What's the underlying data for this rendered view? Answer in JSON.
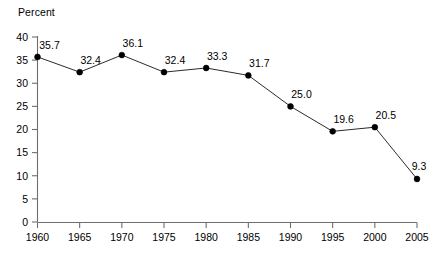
{
  "chart_data": {
    "type": "line",
    "title": "",
    "subtitle": "",
    "xlabel": "",
    "ylabel": "Percent",
    "x": [
      1960,
      1965,
      1970,
      1975,
      1980,
      1985,
      1990,
      1995,
      2000,
      2005
    ],
    "categories": [
      "1960",
      "1965",
      "1970",
      "1975",
      "1980",
      "1985",
      "1990",
      "1995",
      "2000",
      "2005"
    ],
    "values": [
      35.7,
      32.4,
      36.1,
      32.4,
      33.3,
      31.7,
      25.0,
      19.6,
      20.5,
      9.3
    ],
    "point_labels": [
      "35.7",
      "32.4",
      "36.1",
      "32.4",
      "33.3",
      "31.7",
      "25.0",
      "19.6",
      "20.5",
      "9.3"
    ],
    "series": [
      {
        "name": "Percent",
        "values": [
          35.7,
          32.4,
          36.1,
          32.4,
          33.3,
          31.7,
          25.0,
          19.6,
          20.5,
          9.3
        ]
      }
    ],
    "ylim": [
      0,
      40
    ],
    "ytick_values": [
      0,
      5,
      10,
      15,
      20,
      25,
      30,
      35,
      40
    ],
    "ytick_labels": [
      "0",
      "5",
      "10",
      "15",
      "20",
      "25",
      "30",
      "35",
      "40"
    ],
    "xlim": [
      1960,
      2005
    ],
    "xtick_values": [
      1960,
      1965,
      1970,
      1975,
      1980,
      1985,
      1990,
      1995,
      2000,
      2005
    ],
    "xtick_labels": [
      "1960",
      "1965",
      "1970",
      "1975",
      "1980",
      "1985",
      "1990",
      "1995",
      "2000",
      "2005"
    ],
    "grid": false,
    "legend": false,
    "legend_position": "none",
    "marker": "filled-circle",
    "data_labels_shown": true,
    "colors": {
      "line": "#2a2a2a",
      "marker": "#000000",
      "axis": "#6e6e6e",
      "text": "#000000",
      "background": "#ffffff"
    }
  },
  "axis_title_text": "Percent"
}
